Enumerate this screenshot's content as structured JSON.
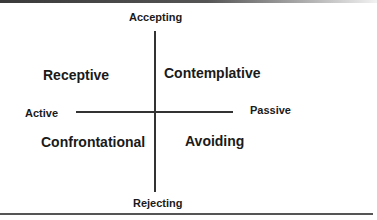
{
  "diagram": {
    "type": "quadrant",
    "axes": {
      "vertical": {
        "top_label": "Accepting",
        "bottom_label": "Rejecting"
      },
      "horizontal": {
        "left_label": "Active",
        "right_label": "Passive"
      }
    },
    "quadrants": {
      "top_left": "Receptive",
      "top_right": "Contemplative",
      "bottom_left": "Confrontational",
      "bottom_right": "Avoiding"
    },
    "colors": {
      "text": "#1a1a1a",
      "axis_line": "#333333",
      "border": "#555555",
      "background": "#ffffff"
    }
  }
}
